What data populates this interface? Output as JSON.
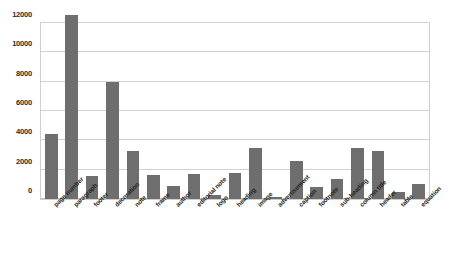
{
  "chart_data": {
    "type": "bar",
    "title": "",
    "subtitle": "",
    "xlabel": "",
    "ylabel": "",
    "ylim": [
      0,
      12000
    ],
    "yticks": [
      0,
      2000,
      4000,
      6000,
      8000,
      10000,
      12000
    ],
    "ytick_labels": [
      "0",
      "2000",
      "4000",
      "6000",
      "8000",
      "10000",
      "12000"
    ],
    "grid": true,
    "legend": false,
    "legend_position": "none",
    "orientation": "vertical",
    "bar_color": "#6e6e6e",
    "grid_color": "#d2d2d2",
    "frame_color": "#cfcfcf",
    "background_color": "#ffffff",
    "xtick_rotation": -45,
    "categories": [
      "page number",
      "paragraph",
      "footer",
      "decoration",
      "note",
      "frame",
      "author",
      "editorial note",
      "logo",
      "heading",
      "image",
      "advertisement",
      "caption",
      "footnote",
      "sub-heading",
      "column title",
      "header",
      "table",
      "equation"
    ],
    "values": [
      4400,
      12550,
      1600,
      8000,
      3250,
      1650,
      900,
      1700,
      300,
      1800,
      3450,
      150,
      2600,
      800,
      1350,
      3450,
      3300,
      450,
      1050
    ]
  }
}
